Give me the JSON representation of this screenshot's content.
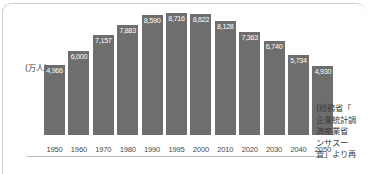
{
  "chart_data": {
    "type": "bar",
    "title": "",
    "subtitle": "",
    "xlabel": "",
    "ylabel": "",
    "unit_label": "(万人)",
    "ylim": [
      0,
      8716
    ],
    "grid": false,
    "legend": null,
    "categories": [
      "1950",
      "1960",
      "1970",
      "1980",
      "1990",
      "1995",
      "2000",
      "2010",
      "2020",
      "2030",
      "2040",
      "2050"
    ],
    "values": [
      4966,
      6000,
      7157,
      7883,
      8590,
      8716,
      8622,
      8128,
      7363,
      6740,
      5734,
      4930
    ],
    "value_labels": [
      "4,966",
      "6,000",
      "7,157",
      "7,883",
      "8,590",
      "8,716",
      "8,622",
      "8,128",
      "7,363",
      "6,740",
      "5,734",
      "4,930"
    ],
    "bar_color": "#6e6e6e",
    "label_color": "#ffffff",
    "tick_color": "#4a4a4a"
  },
  "source_note": {
    "lines": [
      "(総務省「",
      "企業統計調",
      "済産業省",
      "ンサスー",
      "査」より再"
    ]
  }
}
